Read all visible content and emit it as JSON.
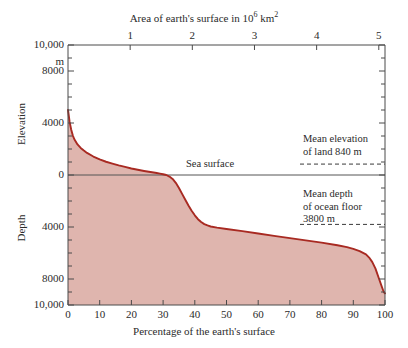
{
  "chart_data": {
    "type": "area",
    "title": "",
    "xlabel": "Percentage of the earth's surface",
    "ylabel_upper": "Elevation",
    "ylabel_lower": "Depth",
    "top_axis_label": "Area of earth's surface in 10⁶ km²",
    "top_axis_label_main": "Area of earth's surface in 10",
    "top_axis_label_sup": "6",
    "top_axis_label_tail": " km",
    "top_axis_label_sup2": "2",
    "y_unit": "m",
    "xlim": [
      0,
      100
    ],
    "ylim": [
      -10000,
      10000
    ],
    "y_ticks_major": [
      10000,
      8000,
      4000,
      0,
      4000,
      8000,
      10000
    ],
    "y_tick_labels": [
      "10,000",
      "8000",
      "4000",
      "0",
      "4000",
      "8000",
      "10,000"
    ],
    "y_tick_values": [
      10000,
      8000,
      4000,
      0,
      -4000,
      -8000,
      -10000
    ],
    "y_minor_step": 1000,
    "x_ticks": [
      0,
      10,
      20,
      30,
      40,
      50,
      60,
      70,
      80,
      90,
      100
    ],
    "x_tick_labels": [
      "0",
      "10",
      "20",
      "30",
      "40",
      "50",
      "60",
      "70",
      "80",
      "90",
      "100"
    ],
    "top_x_ticks": [
      1,
      2,
      3,
      4,
      5
    ],
    "top_x_tick_labels": [
      "1",
      "2",
      "3",
      "4",
      "5"
    ],
    "top_x_max": 5.1,
    "grid": false,
    "legend": "none",
    "curve_name": "Hypsographic curve",
    "curve_color": "#a82a22",
    "fill_color": "#dfb5ae",
    "points": [
      [
        0,
        5000
      ],
      [
        0.5,
        4100
      ],
      [
        1,
        3500
      ],
      [
        1.5,
        3050
      ],
      [
        2,
        2750
      ],
      [
        3,
        2350
      ],
      [
        4,
        2080
      ],
      [
        5,
        1880
      ],
      [
        6,
        1700
      ],
      [
        8,
        1420
      ],
      [
        10,
        1200
      ],
      [
        12,
        1020
      ],
      [
        14,
        880
      ],
      [
        16,
        740
      ],
      [
        18,
        620
      ],
      [
        20,
        500
      ],
      [
        22,
        400
      ],
      [
        24,
        310
      ],
      [
        26,
        230
      ],
      [
        28,
        150
      ],
      [
        29,
        110
      ],
      [
        30,
        60
      ],
      [
        31,
        0
      ],
      [
        32,
        -120
      ],
      [
        33,
        -300
      ],
      [
        34,
        -600
      ],
      [
        35,
        -1000
      ],
      [
        36,
        -1450
      ],
      [
        37,
        -1900
      ],
      [
        38,
        -2350
      ],
      [
        39,
        -2750
      ],
      [
        40,
        -3100
      ],
      [
        41,
        -3400
      ],
      [
        42,
        -3620
      ],
      [
        43,
        -3780
      ],
      [
        44,
        -3880
      ],
      [
        45,
        -3960
      ],
      [
        47,
        -4050
      ],
      [
        50,
        -4150
      ],
      [
        55,
        -4320
      ],
      [
        60,
        -4500
      ],
      [
        65,
        -4680
      ],
      [
        70,
        -4860
      ],
      [
        75,
        -5030
      ],
      [
        80,
        -5200
      ],
      [
        85,
        -5400
      ],
      [
        88,
        -5550
      ],
      [
        90,
        -5680
      ],
      [
        92,
        -5850
      ],
      [
        94,
        -6100
      ],
      [
        95,
        -6350
      ],
      [
        96,
        -6700
      ],
      [
        97,
        -7200
      ],
      [
        98,
        -7900
      ],
      [
        99,
        -8600
      ],
      [
        99.6,
        -9000
      ],
      [
        100,
        -9100
      ]
    ],
    "annotations": [
      {
        "name": "sea-surface",
        "text": "Sea surface",
        "value": 0
      },
      {
        "name": "mean-land-elevation",
        "line1": "Mean elevation",
        "line2": "of land 840 m",
        "value": 840
      },
      {
        "name": "mean-ocean-depth",
        "line1": "Mean depth",
        "line2": "of ocean floor",
        "line3": "3800 m",
        "value": -3800
      }
    ]
  }
}
